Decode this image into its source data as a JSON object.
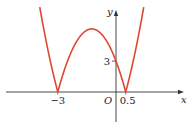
{
  "chart_data": {
    "type": "line",
    "title": "",
    "function": "y = |2x^2 + 5x - 3|",
    "xlabel": "x",
    "ylabel": "y",
    "origin_label": "O",
    "xlim": [
      -5.9,
      3.9
    ],
    "ylim": [
      -3.1,
      8.9
    ],
    "grid": false,
    "x_ticks": [
      {
        "value": -3,
        "label": "-3"
      },
      {
        "value": 0.5,
        "label": "0.5"
      }
    ],
    "y_ticks": [
      {
        "value": 3,
        "label": "3"
      }
    ],
    "series": [
      {
        "name": "|2x^2+5x-3|",
        "color": "#e0462e",
        "key_points": [
          {
            "x": -3,
            "y": 0
          },
          {
            "x": -1.25,
            "y": 6.125
          },
          {
            "x": 0,
            "y": 3
          },
          {
            "x": 0.5,
            "y": 0
          }
        ]
      }
    ],
    "axis_color": "#333333"
  }
}
